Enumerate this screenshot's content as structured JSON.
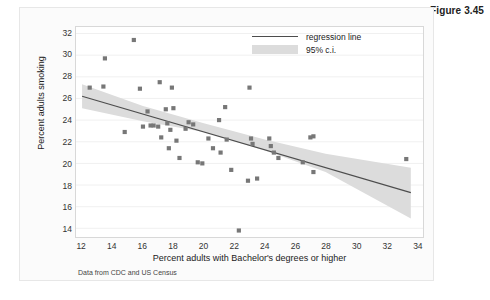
{
  "figure": {
    "number_label": "Figure 3.45",
    "source_note": "Data from CDC and US Census"
  },
  "legend": {
    "position": "top-right",
    "items": [
      {
        "key": "line",
        "label": "regression line",
        "color": "#4d4d4d"
      },
      {
        "key": "band",
        "label": "95% c.i.",
        "color": "#dcdcdc"
      }
    ]
  },
  "colors": {
    "marker": "#777777",
    "regression_line": "#4d4d4d",
    "ci_band": "#dcdcdc",
    "grid": "#f0f0f0",
    "frame": "#d8d8d8",
    "card_background": "#fbfbfb",
    "plot_background": "#ffffff"
  },
  "chart_data": {
    "type": "scatter",
    "title": "",
    "xlabel": "Percent adults with Bachelor's degrees or higher",
    "ylabel": "Percent adults smoking",
    "xlim": [
      11.6,
      34.4
    ],
    "ylim": [
      13.2,
      32.6
    ],
    "xticks": [
      12,
      14,
      16,
      18,
      20,
      22,
      24,
      26,
      28,
      30,
      32,
      34
    ],
    "yticks": [
      14,
      16,
      18,
      20,
      22,
      24,
      26,
      28,
      30,
      32
    ],
    "xtick_labels": [
      "12",
      "14",
      "16",
      "18",
      "20",
      "22",
      "24",
      "26",
      "28",
      "30",
      "32",
      "34"
    ],
    "ytick_labels": [
      "14",
      "16",
      "18",
      "20",
      "22",
      "24",
      "26",
      "28",
      "30",
      "32"
    ],
    "grid": true,
    "grid_axis": "y",
    "legend_position": "top-right",
    "points": [
      [
        12.5,
        27.0
      ],
      [
        13.4,
        27.1
      ],
      [
        13.5,
        29.7
      ],
      [
        14.8,
        22.9
      ],
      [
        15.4,
        31.4
      ],
      [
        15.8,
        26.9
      ],
      [
        16.0,
        23.4
      ],
      [
        16.3,
        24.8
      ],
      [
        16.5,
        23.5
      ],
      [
        16.7,
        23.5
      ],
      [
        17.0,
        23.4
      ],
      [
        17.1,
        27.5
      ],
      [
        17.2,
        22.4
      ],
      [
        17.5,
        25.0
      ],
      [
        17.6,
        23.7
      ],
      [
        17.7,
        21.4
      ],
      [
        17.8,
        23.1
      ],
      [
        17.9,
        27.0
      ],
      [
        18.0,
        25.1
      ],
      [
        18.2,
        22.1
      ],
      [
        18.4,
        20.5
      ],
      [
        18.8,
        23.2
      ],
      [
        19.0,
        23.8
      ],
      [
        19.3,
        23.6
      ],
      [
        19.6,
        20.1
      ],
      [
        19.9,
        20.0
      ],
      [
        20.3,
        22.3
      ],
      [
        20.6,
        21.4
      ],
      [
        21.0,
        24.0
      ],
      [
        21.1,
        21.0
      ],
      [
        21.4,
        25.2
      ],
      [
        21.5,
        22.2
      ],
      [
        21.8,
        19.4
      ],
      [
        22.3,
        13.8
      ],
      [
        22.9,
        18.4
      ],
      [
        23.0,
        27.0
      ],
      [
        23.1,
        22.3
      ],
      [
        23.2,
        21.8
      ],
      [
        23.5,
        18.6
      ],
      [
        24.3,
        22.3
      ],
      [
        24.4,
        21.6
      ],
      [
        24.6,
        21.0
      ],
      [
        24.9,
        20.5
      ],
      [
        26.5,
        20.1
      ],
      [
        27.0,
        22.4
      ],
      [
        27.2,
        22.5
      ],
      [
        27.2,
        19.2
      ],
      [
        33.3,
        20.4
      ]
    ],
    "regression_line": {
      "label": "regression line",
      "x": [
        12.0,
        33.6
      ],
      "y": [
        26.2,
        17.3
      ],
      "slope": -0.412,
      "intercept": 31.15
    },
    "ci_band": {
      "label": "95% c.i.",
      "x": [
        12.0,
        16.0,
        20.0,
        24.0,
        28.0,
        33.6
      ],
      "upper": [
        27.3,
        25.3,
        23.7,
        22.2,
        20.9,
        19.6
      ],
      "lower": [
        25.1,
        23.9,
        22.9,
        21.2,
        19.2,
        14.9
      ]
    }
  }
}
